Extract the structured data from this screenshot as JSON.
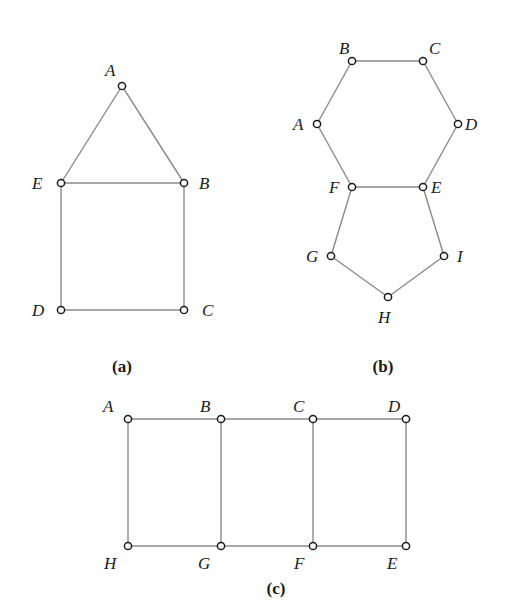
{
  "figure": {
    "graphs": [
      {
        "id": "a",
        "caption": "(a)",
        "caption_pos": [
          122,
          372
        ],
        "nodes": [
          {
            "label": "A",
            "x": 122,
            "y": 86,
            "lx": 105,
            "ly": 76
          },
          {
            "label": "E",
            "x": 61,
            "y": 183,
            "lx": 32,
            "ly": 189
          },
          {
            "label": "B",
            "x": 184,
            "y": 183,
            "lx": 199,
            "ly": 189
          },
          {
            "label": "D",
            "x": 61,
            "y": 310,
            "lx": 32,
            "ly": 316
          },
          {
            "label": "C",
            "x": 184,
            "y": 310,
            "lx": 202,
            "ly": 316
          }
        ],
        "edges": [
          [
            "A",
            "E"
          ],
          [
            "A",
            "B"
          ],
          [
            "E",
            "B"
          ],
          [
            "E",
            "D"
          ],
          [
            "B",
            "C"
          ],
          [
            "D",
            "C"
          ]
        ]
      },
      {
        "id": "b",
        "caption": "(b)",
        "caption_pos": [
          383,
          372
        ],
        "nodes": [
          {
            "label": "B",
            "x": 352,
            "y": 61,
            "lx": 339,
            "ly": 54
          },
          {
            "label": "C",
            "x": 423,
            "y": 61,
            "lx": 429,
            "ly": 54
          },
          {
            "label": "A",
            "x": 317,
            "y": 124,
            "lx": 293,
            "ly": 130
          },
          {
            "label": "D",
            "x": 458,
            "y": 124,
            "lx": 465,
            "ly": 130
          },
          {
            "label": "F",
            "x": 352,
            "y": 187,
            "lx": 329,
            "ly": 193
          },
          {
            "label": "E",
            "x": 423,
            "y": 187,
            "lx": 431,
            "ly": 193
          },
          {
            "label": "G",
            "x": 331,
            "y": 256,
            "lx": 306,
            "ly": 262
          },
          {
            "label": "I",
            "x": 444,
            "y": 256,
            "lx": 457,
            "ly": 262
          },
          {
            "label": "H",
            "x": 388,
            "y": 297,
            "lx": 378,
            "ly": 323
          }
        ],
        "edges": [
          [
            "B",
            "C"
          ],
          [
            "B",
            "A"
          ],
          [
            "C",
            "D"
          ],
          [
            "A",
            "F"
          ],
          [
            "D",
            "E"
          ],
          [
            "F",
            "E"
          ],
          [
            "F",
            "G"
          ],
          [
            "E",
            "I"
          ],
          [
            "G",
            "H"
          ],
          [
            "I",
            "H"
          ]
        ]
      },
      {
        "id": "c",
        "caption": "(c)",
        "caption_pos": [
          276,
          594
        ],
        "nodes": [
          {
            "label": "A",
            "x": 128,
            "y": 419,
            "lx": 103,
            "ly": 412
          },
          {
            "label": "B",
            "x": 221,
            "y": 419,
            "lx": 200,
            "ly": 412
          },
          {
            "label": "C",
            "x": 313,
            "y": 419,
            "lx": 293,
            "ly": 412
          },
          {
            "label": "D",
            "x": 406,
            "y": 419,
            "lx": 388,
            "ly": 412
          },
          {
            "label": "H",
            "x": 128,
            "y": 546,
            "lx": 104,
            "ly": 569
          },
          {
            "label": "G",
            "x": 221,
            "y": 546,
            "lx": 198,
            "ly": 569
          },
          {
            "label": "F",
            "x": 313,
            "y": 546,
            "lx": 294,
            "ly": 569
          },
          {
            "label": "E",
            "x": 406,
            "y": 546,
            "lx": 387,
            "ly": 569
          }
        ],
        "edges": [
          [
            "A",
            "B"
          ],
          [
            "B",
            "C"
          ],
          [
            "C",
            "D"
          ],
          [
            "H",
            "G"
          ],
          [
            "G",
            "F"
          ],
          [
            "F",
            "E"
          ],
          [
            "A",
            "H"
          ],
          [
            "B",
            "G"
          ],
          [
            "C",
            "F"
          ],
          [
            "D",
            "E"
          ]
        ]
      }
    ],
    "colors": {
      "edge": "#8a8a8a",
      "node_stroke": "#1a1a1a",
      "node_fill": "#ffffff",
      "text": "#1a1a1a"
    }
  }
}
